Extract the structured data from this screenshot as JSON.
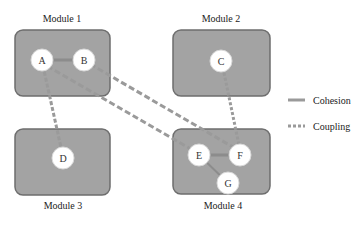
{
  "diagram": {
    "modules": [
      {
        "id": "m1",
        "label": "Module 1"
      },
      {
        "id": "m2",
        "label": "Module 2"
      },
      {
        "id": "m3",
        "label": "Module 3"
      },
      {
        "id": "m4",
        "label": "Module 4"
      }
    ],
    "nodes": [
      {
        "id": "A",
        "label": "A",
        "module": "Module 1"
      },
      {
        "id": "B",
        "label": "B",
        "module": "Module 1"
      },
      {
        "id": "C",
        "label": "C",
        "module": "Module 2"
      },
      {
        "id": "D",
        "label": "D",
        "module": "Module 3"
      },
      {
        "id": "E",
        "label": "E",
        "module": "Module 4"
      },
      {
        "id": "F",
        "label": "F",
        "module": "Module 4"
      },
      {
        "id": "G",
        "label": "G",
        "module": "Module 4"
      }
    ],
    "edges": [
      {
        "from": "A",
        "to": "B",
        "type": "cohesion"
      },
      {
        "from": "E",
        "to": "F",
        "type": "cohesion"
      },
      {
        "from": "E",
        "to": "G",
        "type": "cohesion"
      },
      {
        "from": "A",
        "to": "D",
        "type": "coupling"
      },
      {
        "from": "A",
        "to": "E",
        "type": "coupling"
      },
      {
        "from": "B",
        "to": "F",
        "type": "coupling"
      },
      {
        "from": "C",
        "to": "F",
        "type": "coupling"
      }
    ],
    "legend": {
      "cohesion": "Cohesion",
      "coupling": "Coupling"
    },
    "colors": {
      "module_fill": "#a3a3a3",
      "module_border": "#6e6e6e",
      "node_fill": "#ffffff",
      "edge": "#9a9a9a"
    }
  }
}
